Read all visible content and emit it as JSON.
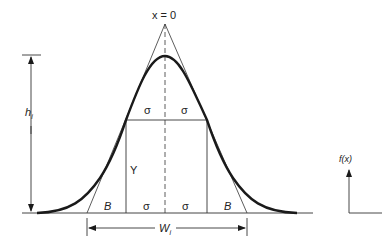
{
  "diagram": {
    "type": "gaussian-peak-geometry",
    "colors": {
      "curve": "#1a1a1a",
      "lines": "#333333",
      "background": "#ffffff"
    },
    "labels": {
      "center": "x = 0",
      "height": "h",
      "height_sub": "i",
      "width": "W",
      "width_sub": "i",
      "sigma_upper_left": "σ",
      "sigma_upper_right": "σ",
      "sigma_lower_left": "σ",
      "sigma_lower_right": "σ",
      "inflection_height": "Y",
      "tangent_base_left": "B",
      "tangent_base_right": "B",
      "axis_label": "f(x)"
    }
  }
}
